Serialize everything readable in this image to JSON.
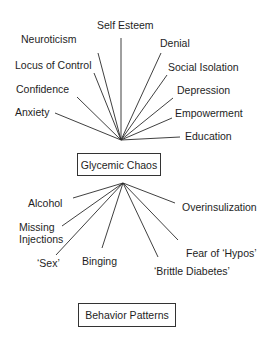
{
  "diagram": {
    "top_hub": {
      "label": "Glycemic Chaos"
    },
    "bottom_hub": {
      "label": "Behavior Patterns"
    },
    "upper_factors": [
      {
        "label": "Self Esteem"
      },
      {
        "label": "Neuroticism"
      },
      {
        "label": "Denial"
      },
      {
        "label": "Locus of Control"
      },
      {
        "label": "Social Isolation"
      },
      {
        "label": "Confidence"
      },
      {
        "label": "Depression"
      },
      {
        "label": "Anxiety"
      },
      {
        "label": "Empowerment"
      },
      {
        "label": "Education"
      }
    ],
    "lower_behaviors": [
      {
        "label": "Alcohol"
      },
      {
        "label": "Overinsulization"
      },
      {
        "label": "Missing"
      },
      {
        "label": "Injections"
      },
      {
        "label": "Fear of ‘Hypos’"
      },
      {
        "label": "‘Sex’"
      },
      {
        "label": "Binging"
      },
      {
        "label": "‘Brittle Diabetes’"
      }
    ],
    "colors": {
      "line": "#222222",
      "text": "#1e1e1e",
      "background": "#ffffff"
    }
  }
}
